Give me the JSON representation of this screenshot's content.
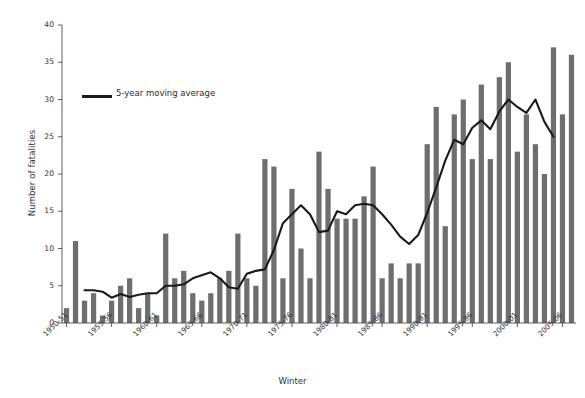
{
  "chart_data": {
    "type": "bar",
    "title": "",
    "xlabel": "Winter",
    "ylabel": "Number of fatalities",
    "ylim": [
      0,
      40
    ],
    "ytick_step": 5,
    "yticks": [
      0,
      5,
      10,
      15,
      20,
      25,
      30,
      35,
      40
    ],
    "grid": false,
    "legend": [
      {
        "label": "5-year moving average",
        "type": "line",
        "color": "#1a1a1a"
      }
    ],
    "legend_position": "upper-left inside plot",
    "bar_color": "#6e6e6e",
    "line_color": "#1a1a1a",
    "axis_color": "#4d4d4d",
    "categories": [
      "1950-51",
      "1951-52",
      "1952-53",
      "1953-54",
      "1954-55",
      "1955-56",
      "1956-57",
      "1957-58",
      "1958-59",
      "1959-60",
      "1960-61",
      "1961-62",
      "1962-63",
      "1963-64",
      "1964-65",
      "1965-66",
      "1966-67",
      "1967-68",
      "1968-69",
      "1969-70",
      "1970-71",
      "1971-72",
      "1972-73",
      "1973-74",
      "1974-75",
      "1975-76",
      "1976-77",
      "1977-78",
      "1978-79",
      "1979-80",
      "1980-81",
      "1981-82",
      "1982-83",
      "1983-84",
      "1984-85",
      "1985-86",
      "1986-87",
      "1987-88",
      "1988-89",
      "1989-90",
      "1990-91",
      "1991-92",
      "1992-93",
      "1993-94",
      "1994-95",
      "1995-96",
      "1996-97",
      "1997-98",
      "1998-99",
      "1999-00",
      "2000-01",
      "2001-02",
      "2002-03",
      "2003-04",
      "2004-05",
      "2005-06",
      "2006-07"
    ],
    "xtick_labels": [
      "1950-51",
      "1955-56",
      "1960-61",
      "1965-66",
      "1970-71",
      "1975-76",
      "1980-81",
      "1985-86",
      "1990-91",
      "1995-96",
      "2000-01",
      "2005-06"
    ],
    "xtick_indices": [
      0,
      5,
      10,
      15,
      20,
      25,
      30,
      35,
      40,
      45,
      50,
      55
    ],
    "series": [
      {
        "name": "Number of fatalities",
        "type": "bar",
        "values": [
          2,
          11,
          3,
          4,
          1,
          3,
          5,
          6,
          2,
          4,
          1,
          12,
          6,
          7,
          4,
          3,
          4,
          6,
          7,
          12,
          6,
          5,
          22,
          21,
          6,
          18,
          10,
          6,
          23,
          18,
          14,
          14,
          14,
          17,
          21,
          6,
          8,
          6,
          8,
          8,
          24,
          29,
          13,
          28,
          30,
          22,
          32,
          22,
          33,
          35,
          23,
          28,
          24,
          20,
          37,
          28,
          36
        ]
      },
      {
        "name": "5-year moving average",
        "type": "line",
        "values": [
          null,
          null,
          4.4,
          4.4,
          4.2,
          3.4,
          3.9,
          3.5,
          3.8,
          4.0,
          4.0,
          5.0,
          5.0,
          5.2,
          6.0,
          6.4,
          6.8,
          6.0,
          4.8,
          4.6,
          6.6,
          7.0,
          7.2,
          9.8,
          13.4,
          14.6,
          15.8,
          14.6,
          12.2,
          12.4,
          15.0,
          14.6,
          15.8,
          16.0,
          15.8,
          14.6,
          13.2,
          11.6,
          10.6,
          11.8,
          14.8,
          18.2,
          21.8,
          24.6,
          24.0,
          26.2,
          27.2,
          26.0,
          28.4,
          30.0,
          29.0,
          28.2,
          30.0,
          27.0,
          25.0,
          null,
          null
        ]
      }
    ]
  }
}
